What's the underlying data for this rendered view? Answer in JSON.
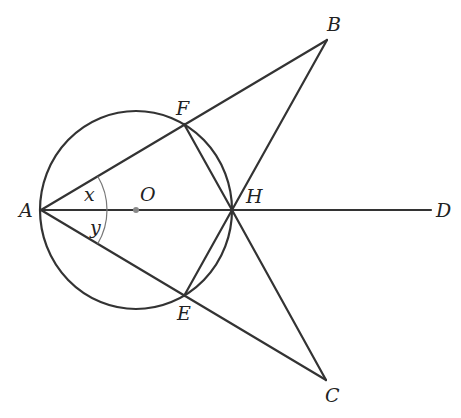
{
  "diagram": {
    "type": "geometry",
    "circle": {
      "center": "O",
      "cx": 136,
      "cy": 210,
      "rx": 96,
      "ry": 99
    },
    "points": {
      "A": {
        "label": "A",
        "x": 41,
        "y": 210,
        "lx": 19,
        "ly": 217
      },
      "O": {
        "label": "O",
        "x": 136,
        "y": 210,
        "lx": 140,
        "ly": 201
      },
      "H": {
        "label": "H",
        "x": 232,
        "y": 210,
        "lx": 246,
        "ly": 203
      },
      "D": {
        "label": "D",
        "x": 431,
        "y": 210,
        "lx": 436,
        "ly": 217
      },
      "B": {
        "label": "B",
        "x": 327,
        "y": 40,
        "lx": 327,
        "ly": 31
      },
      "C": {
        "label": "C",
        "x": 326,
        "y": 380,
        "lx": 325,
        "ly": 402
      },
      "F": {
        "label": "F",
        "x": 184,
        "y": 124,
        "lx": 176,
        "ly": 115
      },
      "E": {
        "label": "E",
        "x": 184,
        "y": 296,
        "lx": 177,
        "ly": 320
      }
    },
    "angles": {
      "x": {
        "label": "x",
        "lx": 84,
        "ly": 201
      },
      "y": {
        "label": "y",
        "lx": 90,
        "ly": 234
      }
    },
    "segments": [
      "AB",
      "AC",
      "AD",
      "BH",
      "CH",
      "FH",
      "EH"
    ],
    "colors": {
      "stroke": "#333333",
      "arc": "#777777",
      "center_dot": "#888888"
    }
  }
}
